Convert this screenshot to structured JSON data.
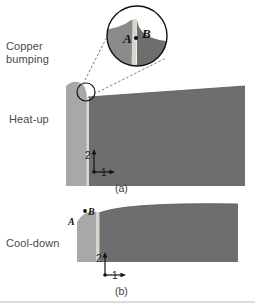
{
  "figure": {
    "labels": {
      "copper_bumping": "Copper\nbumping",
      "heat_up": "Heat-up",
      "cool_down": "Cool-down"
    },
    "captions": {
      "panel_a": "(a)",
      "panel_b": "(b)"
    },
    "axis_indicator": {
      "vertical_axis": "2",
      "horizontal_axis": "1"
    },
    "detail_markers": {
      "point_a": "A",
      "point_b": "B"
    },
    "colors": {
      "dark_gray": "#6e6e6e",
      "light_gray": "#a8a8a8",
      "mid_gray": "#8b8b8b",
      "pale_strip": "#d8d6cd",
      "outline": "#111111",
      "text": "#4a4a4a",
      "background": "#ffffff"
    }
  }
}
